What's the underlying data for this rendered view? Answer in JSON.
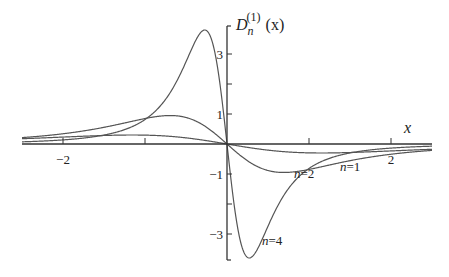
{
  "chart_data": {
    "type": "line",
    "title": "",
    "xlabel": "x",
    "ylabel_main": "D",
    "ylabel_sub": "n",
    "ylabel_sup": "(1)",
    "ylabel_arg": "(x)",
    "xlim": [
      -2.5,
      2.5
    ],
    "ylim": [
      -3.9,
      3.9
    ],
    "x_ticks": [
      {
        "value": -2,
        "label": "−2"
      },
      {
        "value": -1,
        "label": ""
      },
      {
        "value": 0,
        "label": ""
      },
      {
        "value": 1,
        "label": ""
      },
      {
        "value": 2,
        "label": "2"
      }
    ],
    "y_ticks": [
      {
        "value": 3,
        "label": "3"
      },
      {
        "value": 2,
        "label": ""
      },
      {
        "value": 1,
        "label": "1"
      },
      {
        "value": -1,
        "label": "−1"
      },
      {
        "value": -2,
        "label": ""
      },
      {
        "value": -3,
        "label": "−3"
      }
    ],
    "grid": false,
    "legend": "none",
    "curve_model": "f(x) = -K*x/(x^2+a^2)^2",
    "series": [
      {
        "name": "n=1",
        "label_n": "n",
        "label_eq": "=1",
        "K": 7.39,
        "a": 2.0,
        "peak": {
          "x": -1.15,
          "y": 0.3
        },
        "trough": {
          "x": 1.15,
          "y": -0.3
        }
      },
      {
        "name": "n=2",
        "label_n": "n",
        "label_eq": "=2",
        "K": 5.05,
        "a": 1.2,
        "peak": {
          "x": -0.69,
          "y": 0.95
        },
        "trough": {
          "x": 0.69,
          "y": -0.95
        }
      },
      {
        "name": "n=4",
        "label_n": "n",
        "label_eq": "=4",
        "K": 1.215,
        "a": 0.47,
        "peak": {
          "x": -0.27,
          "y": 3.8
        },
        "trough": {
          "x": 0.27,
          "y": -3.8
        }
      }
    ]
  }
}
